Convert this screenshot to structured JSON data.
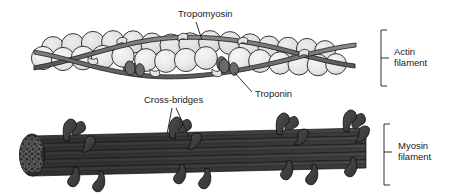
{
  "figure": {
    "background_color": "#ffffff",
    "width": 467,
    "height": 195
  },
  "labels": {
    "tropomyosin": "Tropomyosin",
    "troponin": "Troponin",
    "cross_bridges": "Cross-bridges",
    "actin_filament_line1": "Actin",
    "actin_filament_line2": "filament",
    "myosin_filament_line1": "Myosin",
    "myosin_filament_line2": "filament"
  },
  "colors": {
    "background": "#ffffff",
    "actin_sphere_fill": "#e8e8e8",
    "actin_sphere_fill_back": "#dcdcdc",
    "actin_sphere_stroke": "#1a1a1a",
    "tropomyosin_fill": "#707070",
    "tropomyosin_stroke": "#1a1a1a",
    "troponin_fill": "#6a6a6a",
    "troponin_stroke": "#1a1a1a",
    "myosin_rod_fill": "#3a3a3a",
    "myosin_rod_stroke": "#111111",
    "myosin_head_fill": "#3f3f3f",
    "myosin_head_stroke": "#111111",
    "cross_section_fill": "#2e2e2e",
    "label_text": "#1a1a1a",
    "leader_line": "#1a1a1a"
  },
  "structures": {
    "actin_filament": {
      "name": "Actin filament",
      "description": "Two intertwined strands of globular actin monomers",
      "sphere_count_front": 15,
      "sphere_count_back": 14,
      "tropomyosin_strand_count": 2,
      "troponin_cluster_count": 2
    },
    "myosin_filament": {
      "name": "Myosin filament",
      "description": "Bundle of myosin rods with projecting cross-bridge heads",
      "rod_row_count": 6,
      "cross_bridge_count": 14,
      "cross_section_visible": true
    }
  }
}
